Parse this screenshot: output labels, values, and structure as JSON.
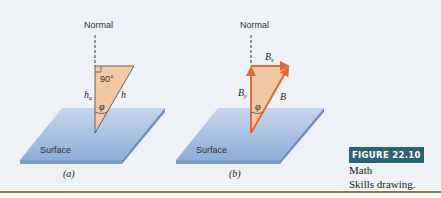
{
  "figure": {
    "number_label": "FIGURE 22.10",
    "caption_text": "Math Skills drawing.",
    "caption_line1": "Math",
    "caption_line2": "Skills drawing."
  },
  "panel_a": {
    "sublabel": "(a)",
    "normal_label": "Normal",
    "surface_label": "Surface",
    "angle_right_label": "90°",
    "side_vertical_label": "h",
    "side_vertical_subscript": "a",
    "hypotenuse_label": "h",
    "angle_label": "φ"
  },
  "panel_b": {
    "sublabel": "(b)",
    "normal_label": "Normal",
    "surface_label": "Surface",
    "top_vector_label": "B",
    "top_vector_subscript": "x",
    "vertical_vector_label": "B",
    "vertical_vector_subscript": "y",
    "hypotenuse_vector_label": "B",
    "angle_label": "φ"
  },
  "colors": {
    "background": "#eef2f6",
    "surface_fill": "#a8c0e0",
    "surface_edge": "#6f8fc0",
    "triangle_fill": "#f0c9a4",
    "vector_orange": "#e0693a",
    "badge_bg": "#2a6473",
    "rule": "#b0664a"
  }
}
